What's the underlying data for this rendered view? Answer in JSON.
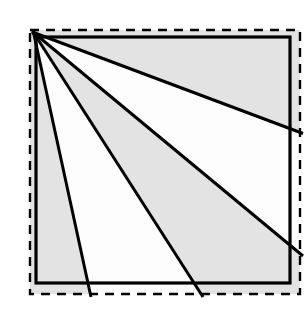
{
  "figure": {
    "canvas": {
      "width": 307,
      "height": 310,
      "background": "#ffffff"
    },
    "colors": {
      "stroke": "#000000",
      "shade_gray": "#e3e3e3",
      "shade_white": "#fdfdfd",
      "dashed_stroke": "#000000",
      "background": "#ffffff"
    },
    "dashed_rect": {
      "name": "dashed-outer-square",
      "x": 30,
      "y": 30,
      "width": 270,
      "height": 264,
      "stroke_width": 2.4,
      "dash_pattern": "9 7",
      "fill": "#e3e3e3"
    },
    "solid_rect": {
      "name": "solid-inner-square",
      "x": 36,
      "y": 37,
      "width": 254,
      "height": 246,
      "stroke_width": 3.2,
      "fill": "none"
    },
    "apex": {
      "x": 33.5,
      "y": 32.5,
      "label": "top-left vertex"
    },
    "rays": [
      {
        "id": "ray-1",
        "x1": 33.5,
        "y1": 32.5,
        "x2": 303,
        "y2": 133.5,
        "stroke_width": 3.0
      },
      {
        "id": "ray-2",
        "x1": 33.5,
        "y1": 32.5,
        "x2": 303,
        "y2": 256.0,
        "stroke_width": 3.0
      },
      {
        "id": "ray-3",
        "x1": 33.5,
        "y1": 32.5,
        "x2": 203.0,
        "y2": 297,
        "stroke_width": 3.0
      },
      {
        "id": "ray-4",
        "x1": 33.5,
        "y1": 32.5,
        "x2": 91.0,
        "y2": 297,
        "stroke_width": 3.0
      }
    ],
    "bands": [
      {
        "id": "band-top",
        "fill": "shade_gray",
        "description": "between top edge and ray-1"
      },
      {
        "id": "band-1-2",
        "fill": "shade_white",
        "description": "between ray-1 and ray-2"
      },
      {
        "id": "band-2-3",
        "fill": "shade_gray",
        "description": "between ray-2 and ray-3"
      },
      {
        "id": "band-3-4",
        "fill": "shade_white",
        "description": "between ray-3 and ray-4"
      },
      {
        "id": "band-left",
        "fill": "shade_gray",
        "description": "between ray-4 and left edge"
      }
    ]
  },
  "chart_data": {
    "type": "diagram",
    "shapes": [
      {
        "kind": "rect",
        "style": "dashed",
        "x": 30,
        "y": 30,
        "w": 270,
        "h": 264
      },
      {
        "kind": "rect",
        "style": "solid",
        "x": 36,
        "y": 37,
        "w": 254,
        "h": 246
      },
      {
        "kind": "ray",
        "from": [
          33.5,
          32.5
        ],
        "to": [
          303,
          133.5
        ]
      },
      {
        "kind": "ray",
        "from": [
          33.5,
          32.5
        ],
        "to": [
          303,
          256.0
        ]
      },
      {
        "kind": "ray",
        "from": [
          33.5,
          32.5
        ],
        "to": [
          203.0,
          297
        ]
      },
      {
        "kind": "ray",
        "from": [
          33.5,
          32.5
        ],
        "to": [
          91.0,
          297
        ]
      }
    ],
    "ray_count": 4,
    "region_count": 5,
    "region_shades": [
      "gray",
      "white",
      "gray",
      "white",
      "gray"
    ],
    "xlabel": "",
    "ylabel": "",
    "annotations": []
  }
}
